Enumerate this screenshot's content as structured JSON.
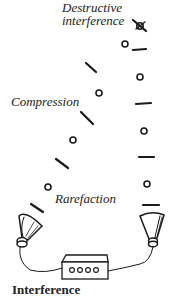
{
  "labels": {
    "destructive_line1": "Destructive",
    "destructive_line2": "interference",
    "compression": "Compression",
    "rarefaction": "Rarefaction"
  },
  "caption": "Interference",
  "colors": {
    "ink": "#1a1a1a",
    "background": "#ffffff"
  },
  "elements": {
    "left_wave": {
      "compressions": 4,
      "rarefactions": 3
    },
    "right_wave": {
      "compressions": 5,
      "rarefactions": 4
    },
    "speakers": 2,
    "amplifier_knobs": 4
  }
}
